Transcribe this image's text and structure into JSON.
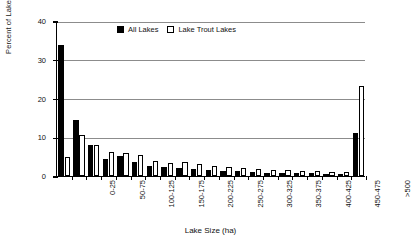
{
  "chart_data": {
    "type": "bar",
    "title": "",
    "xlabel": "Lake Size (ha)",
    "ylabel": "Percent of Lakes",
    "ylim": [
      0,
      40
    ],
    "yticks": [
      0,
      10,
      20,
      30,
      40
    ],
    "grid": "horizontal",
    "legend_position": "top-center",
    "categories": [
      "0-25",
      "25-50",
      "50-75",
      "75-100",
      "100-125",
      "125-150",
      "150-175",
      "175-200",
      "200-225",
      "225-250",
      "250-275",
      "275-300",
      "300-325",
      "325-350",
      "350-375",
      "375-400",
      "400-425",
      "425-450",
      "450-475",
      "475-500",
      ">500"
    ],
    "tick_labels_shown": [
      "0-25",
      "50-75",
      "100-125",
      "150-175",
      "200-225",
      "250-275",
      "300-325",
      "350-375",
      "400-425",
      "450-475",
      ">500"
    ],
    "series": [
      {
        "name": "All Lakes",
        "color": "#000000",
        "values": [
          33.8,
          14.5,
          8.0,
          4.4,
          5.2,
          3.5,
          2.7,
          2.2,
          2.0,
          1.7,
          1.5,
          1.3,
          1.2,
          1.0,
          0.9,
          0.8,
          0.8,
          0.7,
          0.6,
          0.6,
          11.2
        ]
      },
      {
        "name": "Lake Trout Lakes",
        "color": "#ffffff",
        "values": [
          5.0,
          10.6,
          7.9,
          6.2,
          6.0,
          5.5,
          3.9,
          3.3,
          3.5,
          3.2,
          2.6,
          2.2,
          2.0,
          1.8,
          1.6,
          1.5,
          1.3,
          1.2,
          1.1,
          1.0,
          23.3
        ]
      }
    ]
  },
  "legend": {
    "items": [
      {
        "label": "All Lakes",
        "swatch": "filled-square-icon"
      },
      {
        "label": "Lake Trout Lakes",
        "swatch": "open-square-icon"
      }
    ]
  }
}
